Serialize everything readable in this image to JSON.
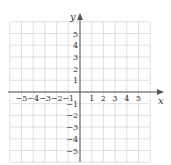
{
  "chart_data": {
    "type": "scatter",
    "title": "",
    "xlabel": "x",
    "ylabel": "y",
    "xlim": [
      -6,
      6
    ],
    "ylim": [
      -6,
      6
    ],
    "grid": true,
    "x_tick_labels": [
      "-5",
      "-4",
      "-3",
      "-2",
      "-1",
      "1",
      "2",
      "3",
      "4",
      "5"
    ],
    "y_tick_labels": [
      "5",
      "4",
      "3",
      "2",
      "1",
      "-1",
      "-2",
      "-3",
      "-4",
      "-5"
    ],
    "series": []
  },
  "colors": {
    "grid": "#d8d8d8",
    "axis": "#555555",
    "text": "#333333"
  }
}
